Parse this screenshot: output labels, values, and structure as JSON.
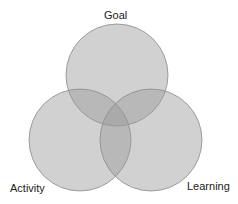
{
  "diagram": {
    "type": "venn",
    "sets": [
      {
        "label": "Goal",
        "cx": 117,
        "cy": 75,
        "r": 51
      },
      {
        "label": "Activity",
        "cx": 80,
        "cy": 140,
        "r": 51
      },
      {
        "label": "Learning",
        "cx": 151,
        "cy": 140,
        "r": 51
      }
    ],
    "colors": {
      "fill": "#9a9a9a",
      "fill_opacity": 0.45,
      "stroke": "#8a8a8a",
      "label": "#222222",
      "background": "#ffffff"
    }
  }
}
